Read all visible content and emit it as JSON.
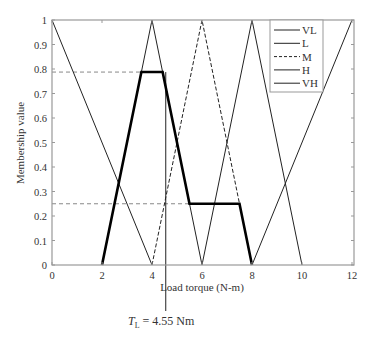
{
  "chart_data": {
    "type": "line",
    "title": "",
    "xlabel": "Load torque (N-m)",
    "ylabel": "Membership value",
    "xlim": [
      0,
      12
    ],
    "ylim": [
      0,
      1
    ],
    "x_ticks": [
      "0",
      "2",
      "4",
      "6",
      "8",
      "10",
      "12"
    ],
    "y_ticks": [
      "0",
      "0.1",
      "0.2",
      "0.3",
      "0.4",
      "0.5",
      "0.6",
      "0.7",
      "0.8",
      "0.9",
      "1"
    ],
    "grid": false,
    "legend_position": "upper right",
    "series": [
      {
        "name": "VL",
        "style": "solid",
        "x": [
          0,
          4
        ],
        "y": [
          1,
          0
        ]
      },
      {
        "name": "L",
        "style": "solid",
        "x": [
          2,
          4,
          6
        ],
        "y": [
          0,
          1,
          0
        ]
      },
      {
        "name": "M",
        "style": "dashed",
        "x": [
          4,
          6,
          8
        ],
        "y": [
          0,
          1,
          0
        ]
      },
      {
        "name": "H",
        "style": "solid",
        "x": [
          6,
          8,
          10
        ],
        "y": [
          0,
          1,
          0
        ]
      },
      {
        "name": "VH",
        "style": "solid",
        "x": [
          8,
          12
        ],
        "y": [
          0,
          1
        ]
      },
      {
        "name": "Aggregated output",
        "style": "thick",
        "x": [
          2,
          3.575,
          4.425,
          5.5,
          7.5,
          8
        ],
        "y": [
          0,
          0.7875,
          0.7875,
          0.25,
          0.25,
          0
        ]
      }
    ],
    "reference_lines": [
      {
        "type": "horizontal",
        "style": "dashed",
        "y": 0.7875,
        "x_end": 4.425
      },
      {
        "type": "horizontal",
        "style": "dashed",
        "y": 0.25,
        "x_end": 7.5
      },
      {
        "type": "vertical",
        "style": "solid",
        "x": 4.55
      }
    ],
    "annotations": [
      {
        "text_main": "T",
        "text_sub": "L",
        "text_rest": " = 4.55 Nm",
        "x": 4.55
      }
    ]
  },
  "legend": {
    "items": [
      {
        "label": "VL",
        "style": "solid"
      },
      {
        "label": "L",
        "style": "solid"
      },
      {
        "label": "M",
        "style": "dashed"
      },
      {
        "label": "H",
        "style": "solid"
      },
      {
        "label": "VH",
        "style": "solid"
      }
    ]
  },
  "annotation": {
    "t": "T",
    "sub": "L",
    "rest": " = 4.55 Nm"
  }
}
